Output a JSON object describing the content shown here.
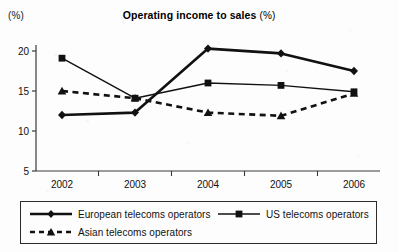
{
  "chart_data": {
    "type": "line",
    "title": "Operating income to sales",
    "title_suffix": "(%)",
    "ylabel_unit": "(%)",
    "xlabel": "",
    "categories": [
      "2002",
      "2003",
      "2004",
      "2005",
      "2006"
    ],
    "yticks": [
      5,
      10,
      15,
      20
    ],
    "ylim": [
      5,
      21
    ],
    "grid": false,
    "legend_position": "bottom",
    "series": [
      {
        "name": "European telecoms operators",
        "values": [
          12.0,
          12.3,
          20.3,
          19.7,
          17.5
        ],
        "marker": "diamond",
        "line_style": "solid",
        "line_width": "thick",
        "color": "#111111"
      },
      {
        "name": "US telecoms operators",
        "values": [
          19.1,
          14.1,
          16.0,
          15.7,
          14.9
        ],
        "marker": "square",
        "line_style": "solid",
        "line_width": "thin",
        "color": "#111111"
      },
      {
        "name": "Asian telecoms operators",
        "values": [
          15.0,
          14.1,
          12.3,
          11.9,
          14.7
        ],
        "marker": "triangle",
        "line_style": "dashed",
        "line_width": "thick",
        "color": "#111111"
      }
    ]
  },
  "legend": {
    "european_label": "European telecoms operators",
    "us_label": "US telecoms operators",
    "asian_label": "Asian telecoms operators"
  }
}
